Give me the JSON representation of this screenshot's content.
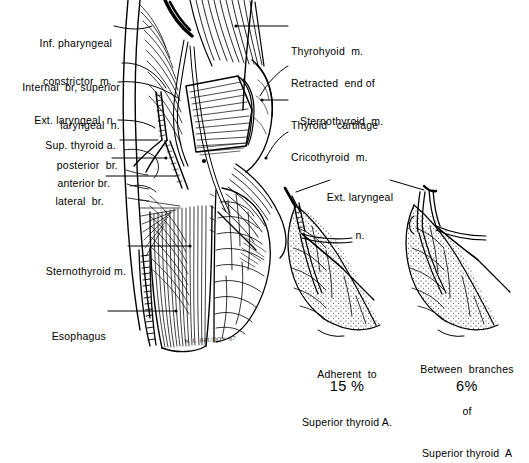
{
  "figure": {
    "signature": "W. L. BRUDON '67",
    "ink_color": "#000000",
    "background_color": "#ffffff"
  },
  "labels_left": [
    {
      "id": "inf-pharyngeal-constrictor",
      "lines": [
        "Inf. pharyngeal",
        "constrictor  m."
      ]
    },
    {
      "id": "internal-br-superior-laryngeal",
      "lines": [
        "Internal  br, superior",
        "laryngeal  n."
      ]
    },
    {
      "id": "ext-laryngeal-n",
      "lines": [
        "Ext. laryngeal  n."
      ]
    },
    {
      "id": "sup-thyroid-a",
      "lines": [
        "Sup. thyroid a."
      ]
    },
    {
      "id": "posterior-br",
      "lines": [
        "posterior  br."
      ]
    },
    {
      "id": "anterior-br",
      "lines": [
        "anterior br."
      ]
    },
    {
      "id": "lateral-br",
      "lines": [
        "lateral  br."
      ]
    },
    {
      "id": "sternothyroid-m",
      "lines": [
        "Sternothyroid m."
      ]
    },
    {
      "id": "esophagus",
      "lines": [
        "Esophagus"
      ]
    }
  ],
  "labels_right": [
    {
      "id": "thyrohyoid-m",
      "lines": [
        "Thyrohyoid  m."
      ]
    },
    {
      "id": "retracted-end-sternothyroid",
      "lines": [
        "Retracted  end of",
        "Sternothyroid  m."
      ]
    },
    {
      "id": "thyroid-cartilage",
      "lines": [
        "Thyroid   cartilage"
      ]
    },
    {
      "id": "cricothyroid-m",
      "lines": [
        "Cricothyroid  m."
      ]
    }
  ],
  "insets": {
    "shared_label": {
      "id": "ext-laryngeal-n-inset",
      "lines": [
        "Ext. laryngeal",
        "n."
      ]
    },
    "items": [
      {
        "id": "inset-adherent",
        "caption_lines": [
          "Adherent  to",
          "Superior thyroid A."
        ],
        "percent": "15 %"
      },
      {
        "id": "inset-between-branches",
        "caption_lines": [
          "Between  branches",
          "of",
          "Superior thyroid  A"
        ],
        "percent": "6%"
      }
    ]
  }
}
